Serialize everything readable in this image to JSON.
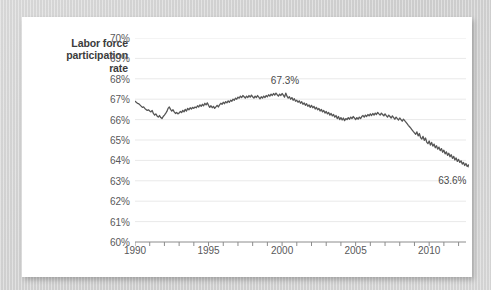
{
  "card": {
    "background_color": "#ffffff",
    "page_background_color": "#d4d4d4"
  },
  "chart_data": {
    "type": "line",
    "title_lines": [
      "Labor force",
      "participation",
      "rate"
    ],
    "xlabel": "",
    "ylabel": "Labor force participation rate",
    "ylim": [
      60,
      70
    ],
    "xlim": [
      1990,
      2012.3
    ],
    "y_tick_labels": [
      "70%",
      "69%",
      "68%",
      "67%",
      "66%",
      "65%",
      "64%",
      "63%",
      "62%",
      "61%",
      "60%"
    ],
    "y_tick_values": [
      70,
      69,
      68,
      67,
      66,
      65,
      64,
      63,
      62,
      61,
      60
    ],
    "x_tick_labels": [
      "1990",
      "1995",
      "2000",
      "2005",
      "2010"
    ],
    "x_tick_values": [
      1990,
      1995,
      2000,
      2005,
      2010
    ],
    "x_minor_tick_step": 1,
    "grid": "horizontal",
    "legend": "none",
    "line_color": "#565656",
    "line_width": 1.3,
    "annotations": [
      {
        "label": "67.3%",
        "x": 2000.2,
        "y": 67.3,
        "placement": "above-peak"
      },
      {
        "label": "63.6%",
        "x": 2012.0,
        "y": 63.6,
        "placement": "below-end"
      }
    ],
    "series": [
      {
        "name": "Labor force participation rate",
        "x_start": 1990.0,
        "x_step": 0.0833333,
        "values": [
          66.9,
          66.85,
          66.8,
          66.78,
          66.72,
          66.66,
          66.6,
          66.62,
          66.55,
          66.5,
          66.45,
          66.48,
          66.42,
          66.38,
          66.45,
          66.3,
          66.22,
          66.28,
          66.18,
          66.12,
          66.2,
          66.1,
          66.05,
          66.15,
          66.22,
          66.3,
          66.4,
          66.55,
          66.62,
          66.5,
          66.42,
          66.48,
          66.38,
          66.3,
          66.35,
          66.28,
          66.32,
          66.4,
          66.34,
          66.45,
          66.38,
          66.5,
          66.42,
          66.55,
          66.48,
          66.58,
          66.52,
          66.6,
          66.55,
          66.62,
          66.58,
          66.68,
          66.62,
          66.72,
          66.65,
          66.75,
          66.68,
          66.8,
          66.72,
          66.82,
          66.7,
          66.6,
          66.68,
          66.58,
          66.65,
          66.55,
          66.62,
          66.7,
          66.62,
          66.72,
          66.8,
          66.75,
          66.85,
          66.78,
          66.88,
          66.82,
          66.92,
          66.85,
          66.95,
          66.9,
          67.0,
          66.95,
          67.05,
          67.0,
          67.1,
          67.05,
          67.15,
          67.08,
          67.18,
          67.12,
          67.05,
          67.15,
          67.08,
          67.18,
          67.1,
          67.2,
          67.12,
          67.05,
          67.15,
          67.08,
          67.18,
          67.1,
          67.02,
          67.12,
          67.05,
          67.15,
          67.08,
          67.18,
          67.12,
          67.22,
          67.15,
          67.25,
          67.18,
          67.28,
          67.2,
          67.3,
          67.22,
          67.15,
          67.25,
          67.18,
          67.28,
          67.2,
          67.1,
          67.3,
          67.15,
          67.05,
          67.12,
          67.0,
          67.08,
          66.95,
          67.02,
          66.9,
          66.95,
          66.85,
          66.92,
          66.8,
          66.88,
          66.75,
          66.82,
          66.7,
          66.78,
          66.65,
          66.72,
          66.6,
          66.7,
          66.58,
          66.65,
          66.52,
          66.6,
          66.48,
          66.55,
          66.42,
          66.5,
          66.38,
          66.45,
          66.32,
          66.4,
          66.28,
          66.35,
          66.22,
          66.3,
          66.18,
          66.25,
          66.12,
          66.2,
          66.05,
          66.15,
          66.0,
          66.1,
          65.98,
          66.08,
          65.95,
          66.05,
          66.0,
          66.1,
          66.02,
          66.12,
          66.05,
          66.15,
          66.08,
          66.0,
          66.1,
          66.02,
          66.12,
          66.05,
          66.15,
          66.2,
          66.12,
          66.22,
          66.15,
          66.25,
          66.18,
          66.28,
          66.2,
          66.3,
          66.22,
          66.32,
          66.25,
          66.35,
          66.28,
          66.22,
          66.32,
          66.25,
          66.18,
          66.28,
          66.2,
          66.12,
          66.22,
          66.15,
          66.08,
          66.18,
          66.1,
          66.02,
          66.12,
          66.05,
          65.98,
          66.08,
          66.0,
          65.92,
          66.02,
          65.95,
          65.88,
          65.8,
          65.72,
          65.65,
          65.58,
          65.5,
          65.42,
          65.35,
          65.28,
          65.4,
          65.2,
          65.32,
          65.12,
          65.05,
          65.18,
          64.98,
          65.1,
          64.9,
          64.82,
          64.95,
          64.75,
          64.88,
          64.7,
          64.8,
          64.62,
          64.72,
          64.55,
          64.65,
          64.48,
          64.58,
          64.4,
          64.5,
          64.32,
          64.42,
          64.25,
          64.35,
          64.18,
          64.28,
          64.1,
          64.2,
          64.02,
          64.12,
          63.95,
          64.05,
          63.9,
          63.98,
          63.82,
          63.9,
          63.75,
          63.85,
          63.7,
          63.78,
          63.62,
          63.7,
          63.6
        ]
      }
    ]
  }
}
